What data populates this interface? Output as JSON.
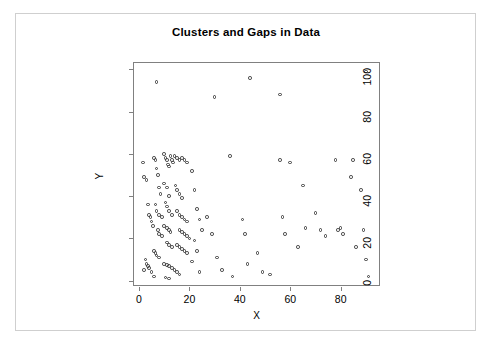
{
  "figure": {
    "background_color": "#ffffff",
    "frame_color": "#cfcfcf",
    "panel_border_color": "#808080",
    "marker_color": "#3a3a3a"
  },
  "chart_data": {
    "type": "scatter",
    "title": "Clusters and Gaps in Data",
    "xlabel": "X",
    "ylabel": "Y",
    "xlim": [
      -2,
      96
    ],
    "ylim": [
      -3,
      103
    ],
    "xticks": [
      0,
      20,
      40,
      60,
      80
    ],
    "yticks": [
      0,
      20,
      40,
      60,
      80,
      100
    ],
    "grid": false,
    "legend": null,
    "marker": "open-circle",
    "series": [
      {
        "name": "points",
        "points": [
          [
            7,
            94
          ],
          [
            30,
            87
          ],
          [
            44,
            96
          ],
          [
            56,
            88
          ],
          [
            90,
            99
          ],
          [
            1.5,
            56
          ],
          [
            2,
            49
          ],
          [
            3,
            47.5
          ],
          [
            3.5,
            36
          ],
          [
            4,
            31
          ],
          [
            4.5,
            30
          ],
          [
            5,
            28
          ],
          [
            5.5,
            26
          ],
          [
            2.5,
            10
          ],
          [
            3,
            8
          ],
          [
            3.5,
            7
          ],
          [
            4,
            6
          ],
          [
            2,
            5
          ],
          [
            5,
            4
          ],
          [
            6,
            58
          ],
          [
            6.5,
            57
          ],
          [
            7,
            53
          ],
          [
            7.5,
            50
          ],
          [
            8,
            44
          ],
          [
            8.5,
            41
          ],
          [
            6.5,
            36
          ],
          [
            7,
            33
          ],
          [
            8,
            31
          ],
          [
            9,
            30
          ],
          [
            7.5,
            24
          ],
          [
            8,
            22
          ],
          [
            9,
            21
          ],
          [
            6,
            14
          ],
          [
            6.5,
            13
          ],
          [
            7,
            12
          ],
          [
            8,
            11
          ],
          [
            6,
            2
          ],
          [
            10,
            60
          ],
          [
            10.5,
            58
          ],
          [
            11,
            57
          ],
          [
            11.5,
            55
          ],
          [
            12,
            54
          ],
          [
            12.5,
            59
          ],
          [
            13,
            57
          ],
          [
            13.5,
            56
          ],
          [
            10,
            46
          ],
          [
            11,
            44
          ],
          [
            12,
            40
          ],
          [
            10.5,
            37
          ],
          [
            11,
            35
          ],
          [
            12,
            33
          ],
          [
            13,
            31
          ],
          [
            10,
            26
          ],
          [
            11,
            25
          ],
          [
            12,
            24
          ],
          [
            12.5,
            23
          ],
          [
            11,
            18
          ],
          [
            12,
            17
          ],
          [
            13,
            16
          ],
          [
            10,
            8
          ],
          [
            11,
            7.5
          ],
          [
            12,
            7
          ],
          [
            13,
            6
          ],
          [
            10.5,
            1.5
          ],
          [
            12,
            1
          ],
          [
            14,
            59
          ],
          [
            15,
            58
          ],
          [
            16,
            57
          ],
          [
            17,
            58
          ],
          [
            18,
            57
          ],
          [
            19,
            56
          ],
          [
            14.5,
            45
          ],
          [
            15,
            43
          ],
          [
            16,
            41
          ],
          [
            17,
            39
          ],
          [
            15,
            33
          ],
          [
            16,
            31
          ],
          [
            17,
            30
          ],
          [
            18,
            29
          ],
          [
            19,
            28
          ],
          [
            16,
            24
          ],
          [
            17,
            23
          ],
          [
            18,
            22
          ],
          [
            19,
            21
          ],
          [
            20,
            20
          ],
          [
            15,
            17
          ],
          [
            16,
            16
          ],
          [
            17,
            15
          ],
          [
            18,
            14
          ],
          [
            19,
            13
          ],
          [
            14,
            5
          ],
          [
            15,
            4
          ],
          [
            16,
            3
          ],
          [
            21,
            52
          ],
          [
            22,
            43
          ],
          [
            23,
            34
          ],
          [
            24,
            29
          ],
          [
            25,
            24
          ],
          [
            22,
            19
          ],
          [
            23,
            14
          ],
          [
            21,
            9
          ],
          [
            24,
            4
          ],
          [
            27,
            30
          ],
          [
            29,
            22
          ],
          [
            31,
            11
          ],
          [
            33,
            5
          ],
          [
            36,
            59
          ],
          [
            37,
            2
          ],
          [
            41,
            29
          ],
          [
            42,
            22
          ],
          [
            43,
            8
          ],
          [
            47,
            13
          ],
          [
            49,
            4
          ],
          [
            52,
            3
          ],
          [
            56,
            57
          ],
          [
            57,
            30
          ],
          [
            58,
            22
          ],
          [
            60,
            56
          ],
          [
            63,
            16
          ],
          [
            65,
            45
          ],
          [
            66,
            25
          ],
          [
            70,
            32
          ],
          [
            72,
            24
          ],
          [
            74,
            21
          ],
          [
            78,
            57
          ],
          [
            79,
            24
          ],
          [
            80,
            25
          ],
          [
            81,
            22
          ],
          [
            84,
            49
          ],
          [
            85,
            57
          ],
          [
            86,
            16
          ],
          [
            88,
            43
          ],
          [
            89,
            24
          ],
          [
            90,
            10
          ],
          [
            91,
            2
          ]
        ]
      }
    ]
  }
}
